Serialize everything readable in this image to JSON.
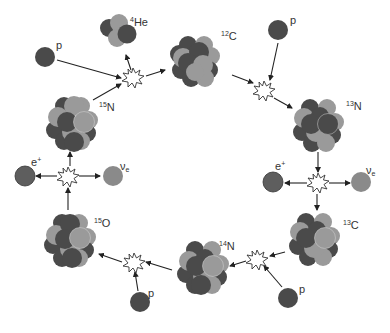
{
  "colors": {
    "proton": "#4a4a4a",
    "neutron": "#9a9a9a",
    "positron": "#5e5e5e",
    "neutrino": "#8a8a8a",
    "arrow": "#222222",
    "background": "#ffffff"
  },
  "nuclei": [
    {
      "id": "c12",
      "mass": "12",
      "symbol": "C"
    },
    {
      "id": "n13",
      "mass": "13",
      "symbol": "N"
    },
    {
      "id": "c13",
      "mass": "13",
      "symbol": "C"
    },
    {
      "id": "n14",
      "mass": "14",
      "symbol": "N"
    },
    {
      "id": "o15",
      "mass": "15",
      "symbol": "O"
    },
    {
      "id": "n15",
      "mass": "15",
      "symbol": "N"
    },
    {
      "id": "he4",
      "mass": "4",
      "symbol": "He"
    }
  ],
  "particles": {
    "proton_label": "p",
    "positron_label": "e",
    "positron_charge": "+",
    "neutrino_label": "ν",
    "neutrino_sub": "e"
  },
  "cycle_steps": [
    {
      "from": "12C",
      "plus": "p",
      "to": "13N"
    },
    {
      "from": "13N",
      "decay": [
        "e+",
        "νe"
      ],
      "to": "13C"
    },
    {
      "from": "13C",
      "plus": "p",
      "to": "14N"
    },
    {
      "from": "14N",
      "plus": "p",
      "to": "15O"
    },
    {
      "from": "15O",
      "decay": [
        "e+",
        "νe"
      ],
      "to": "15N"
    },
    {
      "from": "15N",
      "plus": "p",
      "to": "12C",
      "emits": "4He"
    }
  ]
}
